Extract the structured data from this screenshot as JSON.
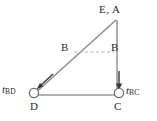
{
  "figure": {
    "type": "structural-truss-diagram",
    "labels": {
      "apex": "E, A",
      "b_left": "B",
      "b_right": "B",
      "d": "D",
      "c": "C"
    },
    "forces": [
      {
        "id": "t_bd",
        "symbol": "t",
        "subscript": "BD",
        "direction": "down-left-diagonal",
        "applied_at": "D"
      },
      {
        "id": "t_bc",
        "symbol": "t",
        "subscript": "BC",
        "direction": "down-vertical",
        "applied_at": "C"
      }
    ],
    "geometry": {
      "apex": [
        116,
        20
      ],
      "d": [
        33,
        95
      ],
      "c": [
        118,
        95
      ],
      "b_left_point": [
        75,
        52
      ],
      "b_right_point": [
        118,
        52
      ]
    },
    "colors": {
      "member": "#8f8f8f",
      "dashed": "#b0b0b0",
      "support": "#6e6e6e",
      "arrow": "#3a3a3a",
      "text": "#2b2b2b",
      "background": "#ffffff"
    }
  }
}
